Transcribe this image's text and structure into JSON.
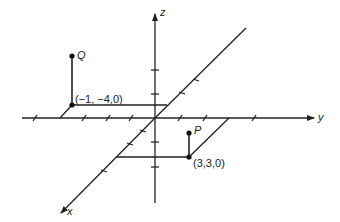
{
  "diagram": {
    "type": "3d-coordinate-axes",
    "axes": {
      "x": {
        "label": "x"
      },
      "y": {
        "label": "y"
      },
      "z": {
        "label": "z"
      }
    },
    "points": [
      {
        "name": "Q",
        "label": "Q",
        "base_label": "(−1, −4,0)",
        "base": [
          -1,
          -4,
          0
        ]
      },
      {
        "name": "P",
        "label": "P",
        "base_label": "(3,3,0)",
        "base": [
          3,
          3,
          0
        ]
      }
    ],
    "colors": {
      "line": "#222222",
      "background": "#ffffff"
    }
  }
}
